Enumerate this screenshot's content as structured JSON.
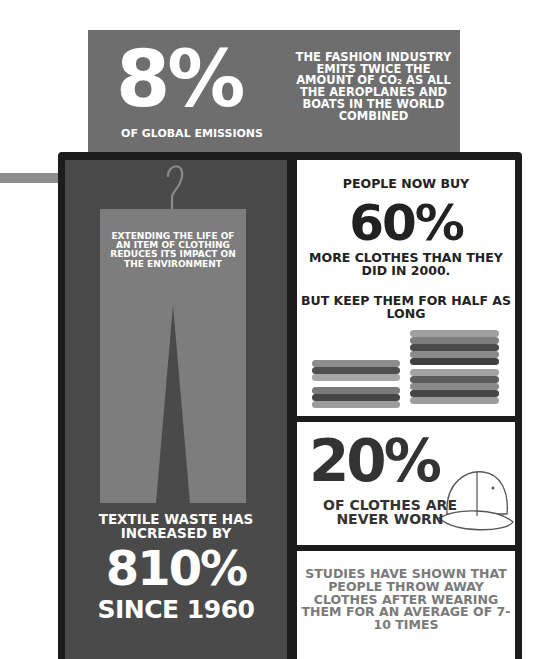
{
  "top_banner": {
    "big_stat": "8%",
    "big_label": "OF GLOBAL EMISSIONS",
    "side_text": "THE FASHION INDUSTRY EMITS TWICE THE AMOUNT OF CO₂ AS ALL THE AEROPLANES AND BOATS IN THE WORLD COMBINED"
  },
  "left_panel": {
    "trousers_text": "EXTENDING THE LIFE OF AN ITEM OF CLOTHING REDUCES ITS IMPACT ON THE ENVIRONMENT",
    "waste_intro": "TEXTILE WASTE HAS INCREASED BY",
    "waste_stat": "810%",
    "waste_since": "SINCE 1960"
  },
  "panel_60": {
    "intro": "PEOPLE NOW BUY",
    "stat": "60%",
    "middle": "MORE CLOTHES THAN THEY DID IN 2000.",
    "lower": "BUT KEEP THEM FOR HALF AS LONG"
  },
  "panel_20": {
    "stat": "20%",
    "text": "OF CLOTHES ARE NEVER WORN"
  },
  "panel_study": {
    "text": "STUDIES HAVE SHOWN THAT PEOPLE THROW AWAY CLOTHES AFTER WEARING THEM FOR AN AVERAGE OF 7-10 TIMES"
  },
  "colors": {
    "banner": "#6e6e6e",
    "frame": "#1c1c1c",
    "left_panel": "#4a4a4a",
    "trousers": "#7d7d7d",
    "accent_bar": "#8d8d8d"
  }
}
